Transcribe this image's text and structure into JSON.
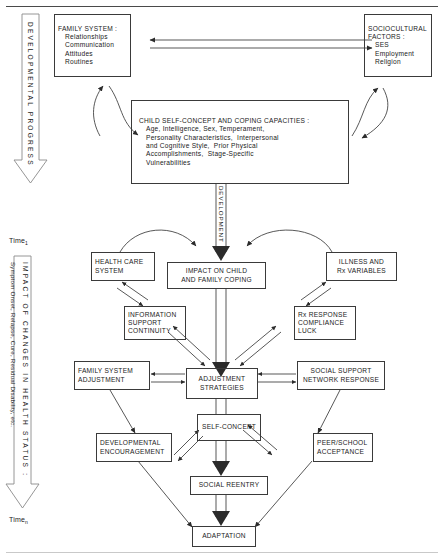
{
  "figure": {
    "title_rule_top": true,
    "title_rule_bottom": true,
    "background": "#ffffff",
    "stroke": "#3a3a3a"
  },
  "time_markers": {
    "top_label": "Time",
    "top_sub": "1",
    "bottom_label": "Time",
    "bottom_sub": "n"
  },
  "vertical_arrows": [
    {
      "id": "developmental-progress",
      "label": "DEVELOPMENTAL  PROGRESS",
      "direction": "down"
    },
    {
      "id": "impact-of-changes",
      "label_main": "IMPACT  OF  CHANGES  IN  HEALTH  STATUS :",
      "label_sub": "Symptom Onset, Relapse, Cure, Residual Disability, etc.",
      "direction": "down"
    }
  ],
  "inline_labels": [
    {
      "id": "development",
      "text": "DEVELOPMENT"
    }
  ],
  "boxes": [
    {
      "id": "family-system",
      "lines": [
        "FAMILY SYSTEM :",
        "Relationships",
        "Communication",
        "Attitudes",
        "Routines"
      ],
      "indent": [
        false,
        true,
        true,
        true,
        true
      ],
      "align": "left"
    },
    {
      "id": "sociocultural-factors",
      "lines": [
        "SOCIOCULTURAL",
        "FACTORS :",
        "SES",
        "Employment",
        "Religion"
      ],
      "indent": [
        false,
        false,
        true,
        true,
        true
      ],
      "align": "left"
    },
    {
      "id": "child-self-concept",
      "lines": [
        "CHILD SELF-CONCEPT AND COPING CAPACITIES :",
        "Age, Intelligence, Sex, Temperament,",
        "Personality Characteristics,  Interpersonal",
        "and Cognitive Style,  Prior Physical",
        "Accomplishments,  Stage-Specific",
        "Vulnerabilities"
      ],
      "indent": [
        false,
        true,
        true,
        true,
        true,
        true
      ],
      "align": "left"
    },
    {
      "id": "health-care-system",
      "lines": [
        "HEALTH CARE",
        "SYSTEM"
      ],
      "align": "left"
    },
    {
      "id": "impact-on-child",
      "lines": [
        "IMPACT ON CHILD",
        "AND FAMILY COPING"
      ],
      "align": "center"
    },
    {
      "id": "illness-and-rx-variables",
      "lines": [
        "ILLNESS AND",
        "Rx VARIABLES"
      ],
      "align": "center"
    },
    {
      "id": "information-support-continuity",
      "lines": [
        "INFORMATION",
        "SUPPORT",
        "CONTINUITY"
      ],
      "align": "left"
    },
    {
      "id": "rx-response-compliance-luck",
      "lines": [
        "Rx RESPONSE",
        "COMPLIANCE",
        "LUCK"
      ],
      "align": "left"
    },
    {
      "id": "family-system-adjustment",
      "lines": [
        "FAMILY SYSTEM",
        "ADJUSTMENT"
      ],
      "align": "left"
    },
    {
      "id": "adjustment-strategies",
      "lines": [
        "ADJUSTMENT",
        "STRATEGIES"
      ],
      "align": "center"
    },
    {
      "id": "social-support-network-response",
      "lines": [
        "SOCIAL SUPPORT",
        "NETWORK RESPONSE"
      ],
      "align": "center"
    },
    {
      "id": "developmental-encouragement",
      "lines": [
        "DEVELOPMENTAL",
        "ENCOURAGEMENT"
      ],
      "align": "left"
    },
    {
      "id": "self-concept",
      "lines": [
        "SELF-CONCEPT"
      ],
      "align": "center"
    },
    {
      "id": "peer-school-acceptance",
      "lines": [
        "PEER/SCHOOL",
        "ACCEPTANCE"
      ],
      "align": "left"
    },
    {
      "id": "social-reentry",
      "lines": [
        "SOCIAL REENTRY"
      ],
      "align": "center"
    },
    {
      "id": "adaptation",
      "lines": [
        "ADAPTATION"
      ],
      "align": "center"
    }
  ]
}
